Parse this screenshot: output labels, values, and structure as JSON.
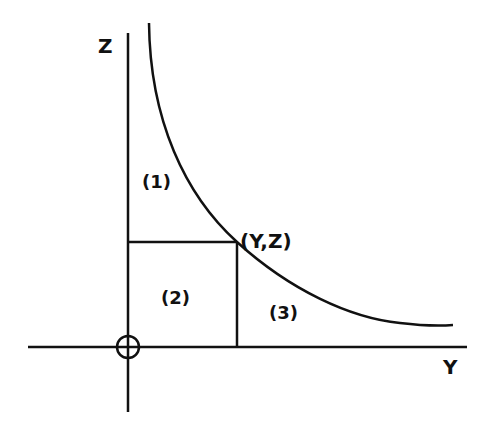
{
  "diagram": {
    "axes": {
      "vertical_label": "Z",
      "horizontal_label": "Y",
      "origin_symbol": "circle-plus"
    },
    "point_label": "(Y,Z)",
    "regions": [
      {
        "id": "1",
        "label": "(1)"
      },
      {
        "id": "2",
        "label": "(2)"
      },
      {
        "id": "3",
        "label": "(3)"
      }
    ],
    "colors": {
      "ink": "#111111",
      "background": "#ffffff"
    }
  }
}
